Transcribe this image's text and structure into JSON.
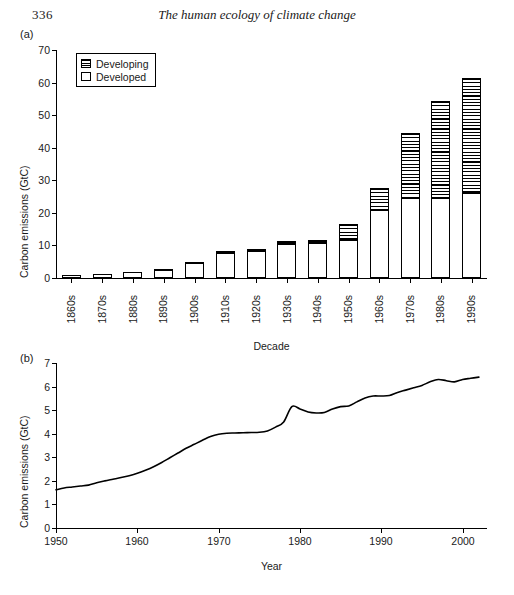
{
  "page": {
    "folio": "336",
    "running_title": "The human ecology of climate change"
  },
  "panel_a": {
    "label": "(a)",
    "legend": {
      "position": "top-left-inside",
      "items": [
        {
          "label": "Developing",
          "swatch": "hatched-horizontal-lines",
          "color": "#000000"
        },
        {
          "label": "Developed",
          "swatch": "white-fill",
          "color": "#ffffff"
        }
      ]
    }
  },
  "panel_b": {
    "label": "(b)"
  },
  "chart_data": [
    {
      "type": "bar",
      "panel": "(a)",
      "subtype": "stacked-vertical",
      "title": "",
      "xlabel": "Decade",
      "ylabel": "Carbon emissions (GtC)",
      "ylim": [
        0,
        70
      ],
      "yticks": [
        0,
        10,
        20,
        30,
        40,
        50,
        60,
        70
      ],
      "grid": false,
      "legend": [
        "Developing",
        "Developed"
      ],
      "legend_position": "inside top-left",
      "categories": [
        "1860s",
        "1870s",
        "1880s",
        "1890s",
        "1900s",
        "1910s",
        "1920s",
        "1930s",
        "1940s",
        "1950s",
        "1960s",
        "1970s",
        "1980s",
        "1990s"
      ],
      "series": [
        {
          "name": "Developed",
          "values": [
            1.0,
            1.2,
            1.7,
            2.5,
            4.5,
            7.6,
            8.2,
            10.3,
            10.8,
            11.6,
            21.0,
            24.5,
            24.5,
            26.0
          ]
        },
        {
          "name": "Developing",
          "values": [
            0.1,
            0.1,
            0.2,
            0.4,
            0.4,
            0.7,
            0.7,
            1.1,
            0.8,
            5.0,
            6.5,
            20.0,
            30.0,
            35.5
          ]
        }
      ],
      "totals": [
        1.1,
        1.3,
        1.9,
        2.9,
        4.9,
        8.3,
        8.9,
        11.4,
        11.6,
        16.6,
        27.5,
        44.5,
        54.5,
        61.5
      ]
    },
    {
      "type": "line",
      "panel": "(b)",
      "title": "",
      "xlabel": "Year",
      "ylabel": "Carbon emissions (GtC)",
      "xlim": [
        1950,
        2003
      ],
      "ylim": [
        0,
        7
      ],
      "xticks": [
        1950,
        1960,
        1970,
        1980,
        1990,
        2000
      ],
      "yticks": [
        0,
        1,
        2,
        3,
        4,
        5,
        6,
        7
      ],
      "grid": false,
      "legend": [],
      "x": [
        1950,
        1951,
        1952,
        1953,
        1954,
        1955,
        1956,
        1957,
        1958,
        1959,
        1960,
        1961,
        1962,
        1963,
        1964,
        1965,
        1966,
        1967,
        1968,
        1969,
        1970,
        1971,
        1972,
        1973,
        1974,
        1975,
        1976,
        1977,
        1978,
        1979,
        1980,
        1981,
        1982,
        1983,
        1984,
        1985,
        1986,
        1987,
        1988,
        1989,
        1990,
        1991,
        1992,
        1993,
        1994,
        1995,
        1996,
        1997,
        1998,
        1999,
        2000,
        2001,
        2002
      ],
      "y": [
        1.62,
        1.7,
        1.74,
        1.78,
        1.82,
        1.92,
        2.0,
        2.07,
        2.14,
        2.22,
        2.32,
        2.45,
        2.6,
        2.78,
        2.98,
        3.18,
        3.38,
        3.55,
        3.72,
        3.88,
        3.98,
        4.02,
        4.03,
        4.04,
        4.05,
        4.06,
        4.12,
        4.28,
        4.5,
        5.15,
        5.05,
        4.92,
        4.88,
        4.9,
        5.05,
        5.15,
        5.18,
        5.35,
        5.52,
        5.6,
        5.6,
        5.62,
        5.75,
        5.85,
        5.95,
        6.05,
        6.2,
        6.3,
        6.25,
        6.2,
        6.3,
        6.35,
        6.4
      ]
    }
  ]
}
